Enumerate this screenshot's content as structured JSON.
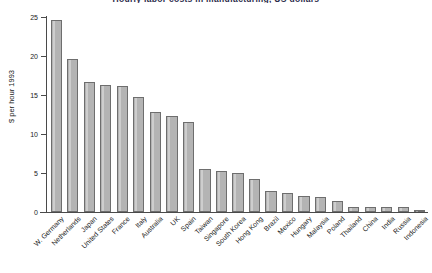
{
  "chart_data": {
    "type": "bar",
    "title": "Hourly labor costs in manufacturing, US dollars",
    "xlabel": "",
    "ylabel": "$ per hour 1993",
    "ylim": [
      0,
      25
    ],
    "yticks": [
      0,
      5,
      10,
      15,
      20,
      25
    ],
    "ytick_labels": [
      "0",
      "5",
      "10",
      "15",
      "20",
      "25"
    ],
    "grid": false,
    "legend": false,
    "bar_fill_color": "#b4b4b4",
    "bar_border_color": "#6e6e6e",
    "axis_color": "#4a4a4a",
    "categories": [
      "W. Germany",
      "Netherlands",
      "Japan",
      "United States",
      "France",
      "Italy",
      "Australia",
      "UK",
      "Spain",
      "Taiwan",
      "Singapore",
      "South Korea",
      "Hong Kong",
      "Brazil",
      "Mexico",
      "Hungary",
      "Malaysia",
      "Poland",
      "Thailand",
      "China",
      "India",
      "Russia",
      "Indonesia"
    ],
    "values": [
      24.6,
      19.6,
      16.7,
      16.3,
      16.1,
      14.8,
      12.8,
      12.3,
      11.6,
      5.5,
      5.2,
      5.0,
      4.2,
      2.7,
      2.4,
      2.0,
      1.9,
      1.4,
      0.7,
      0.6,
      0.6,
      0.6,
      0.3
    ]
  }
}
